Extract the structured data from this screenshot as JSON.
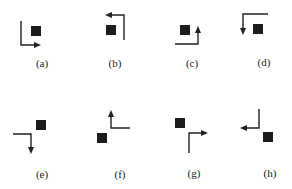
{
  "panels": [
    {
      "id": "a",
      "label": "(a)",
      "description": "square above-right; L path down then right, arrow pointing right"
    },
    {
      "id": "b",
      "label": "(b)",
      "description": "square left; path up then left, arrow pointing left"
    },
    {
      "id": "c",
      "label": "(c)",
      "description": "square left; path right then up, arrow pointing up"
    },
    {
      "id": "d",
      "label": "(d)",
      "description": "square right; path left then down, arrow pointing down"
    },
    {
      "id": "e",
      "label": "(e)",
      "description": "square upper-right; path right then down, arrow pointing down"
    },
    {
      "id": "f",
      "label": "(f)",
      "description": "square lower-left; path left then up, arrow pointing up"
    },
    {
      "id": "g",
      "label": "(g)",
      "description": "square upper-left; path up then right, arrow pointing right"
    },
    {
      "id": "h",
      "label": "(h)",
      "description": "square lower-right; path down then left, arrow pointing left"
    }
  ],
  "colors": {
    "ink": "#222222",
    "square": "#1c1c1c",
    "background": "#ffffff"
  }
}
